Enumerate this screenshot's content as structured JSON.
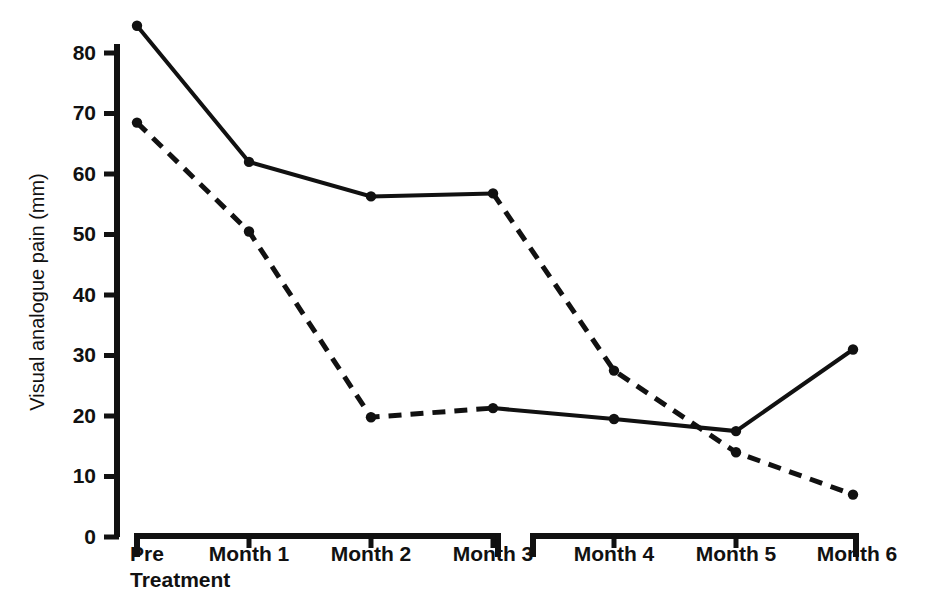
{
  "axes": {
    "ylabel": "Visual analogue pain (mm)",
    "xlabel": "",
    "y_ticks": [
      "0",
      "10",
      "20",
      "30",
      "40",
      "50",
      "60",
      "70",
      "80"
    ],
    "x_categories": [
      "Pre",
      "Treatment",
      "Month 1",
      "Month 2",
      "Month 3",
      "Month 4",
      "Month 5",
      "Month 6"
    ],
    "x_pretreatment_line1": "Pre",
    "x_pretreatment_line2": "Treatment",
    "x_month1": "Month 1",
    "x_month2": "Month 2",
    "x_month3": "Month 3",
    "x_month4": "Month 4",
    "x_month5": "Month 5",
    "x_month6": "Month 6"
  },
  "colors": {
    "ink": "#111111",
    "background": "#ffffff"
  },
  "chart_data": {
    "type": "line",
    "title": "",
    "xlabel": "",
    "ylabel": "Visual analogue pain (mm)",
    "ylim": [
      0,
      80
    ],
    "yticks": [
      0,
      10,
      20,
      30,
      40,
      50,
      60,
      70,
      80
    ],
    "grid": false,
    "legend": "none",
    "categories": [
      "Pre Treatment",
      "Month 1",
      "Month 2",
      "Month 3",
      "Month 4",
      "Month 5",
      "Month 6"
    ],
    "note": "Line styles swap at Month 3: the upper series is solid from Pre Treatment to Month 3 then dashed; the lower series is dashed from Pre Treatment to Month 3 then solid. The two series cross between Month 4 and Month 5.",
    "series": [
      {
        "name": "Upper series",
        "values": [
          84.5,
          62.0,
          56.3,
          56.8,
          27.5,
          14.0,
          7.0
        ],
        "style_by_segment": [
          "solid",
          "solid",
          "solid",
          "dashed",
          "dashed",
          "dashed"
        ],
        "markers": "filled-circle"
      },
      {
        "name": "Lower series",
        "values": [
          68.5,
          50.5,
          19.8,
          21.3,
          19.5,
          17.5,
          31.0
        ],
        "style_by_segment": [
          "dashed",
          "dashed",
          "dashed",
          "solid",
          "solid",
          "solid"
        ],
        "markers": "filled-circle"
      }
    ]
  }
}
